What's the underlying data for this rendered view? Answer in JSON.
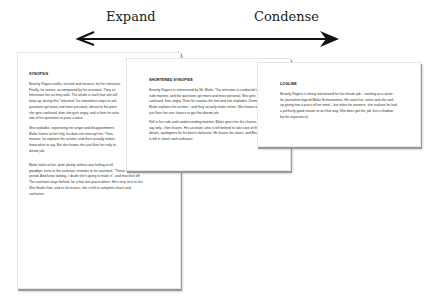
{
  "header": {
    "left_label": "Expand",
    "right_label": "Condense"
  },
  "arrow": {
    "direction": "bidirectional",
    "color": "#111111"
  },
  "pages": [
    {
      "title": "SYNOPSIS",
      "paragraphs": [
        [
          "Beverly Rogers walks, excited and nervous, for her interview.",
          "Finally, he arrives, accompanied by his assistant. They sit.",
          "Interviews her as they walk. The whole is such that she will",
          "keep up; during this \"interview\" he sometimes stops to ask",
          "questions get more and more personal, almost to the point",
          "she gets confused, then she gets angry, and is then he asks",
          "one of his questions to pose a twice."
        ],
        [
          "She explodes, expressing her anger and disappointment.",
          "Blake listens to her fully, he does not interrupt her. Then,",
          "manner, he explains the actions, and then actually makes",
          "know what to say. But she knows she just likes her only to",
          "dream job."
        ],
        [
          "Blake looks at her, quite plainly without any feeling at all,",
          "goodbye; turns to the assistant, motions to his assistant. \"Those months did",
          "period. And keep looking, I doubt she's going to make it\", and marches off.",
          "The assistant stays behind, for a few last practicalities. He's very nice to her.",
          "She thanks him, and as he leaves, she is left in complete shock and",
          "confusion."
        ]
      ]
    },
    {
      "title": "SHORTENED SYNOPSIS",
      "paragraphs": [
        [
          "Beverly Rogers is interviewed by Mr. Blake. The interview is conducted in a",
          "rude manner, and the questions get more and more personal. She gets",
          "confused, then angry. Then he crosses the line and she explodes. Unmoved,",
          "Blake explains the actions - and they actually make sense. She knows at once",
          "just likes her one chance to get that dream job."
        ],
        [
          "Still in his rude and condescending manner, Blake gives her the chance to",
          "say only - then leaves. His assistant, who is left behind to take care of the",
          "details, apologizes for his boss's behavior. He leaves her alone, and Beverly",
          "is left in shock and confusion."
        ]
      ]
    },
    {
      "title": "LOGLINE",
      "paragraphs": [
        [
          "Beverly Rogers is being interviewed for her dream job – working as a writer",
          "for journalism legend Blake Schwartzman. He seats her, notes and she and",
          "up giving him a piece of her mind – but when he answers, she realizes he had",
          "a perfectly good reason to act that way. She does get the job, but a shadow",
          "by the experience)."
        ]
      ]
    }
  ]
}
